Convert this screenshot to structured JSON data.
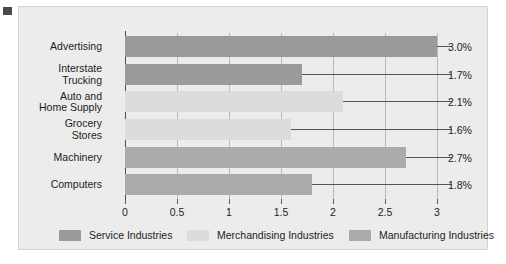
{
  "chart_data": {
    "type": "bar",
    "orientation": "horizontal",
    "title": "",
    "xlabel": "",
    "ylabel": "",
    "xlim": [
      0,
      3
    ],
    "xticks": [
      "0",
      "0.5",
      "1",
      "1.5",
      "2",
      "2.5",
      "3"
    ],
    "grid": true,
    "legend_position": "bottom",
    "categories": [
      "Advertising",
      "Interstate\nTrucking",
      "Auto and\nHome Supply",
      "Grocery\nStores",
      "Machinery",
      "Computers"
    ],
    "values": [
      3.0,
      1.7,
      2.1,
      1.6,
      2.7,
      1.8
    ],
    "value_labels": [
      "3.0%",
      "1.7%",
      "2.1%",
      "1.6%",
      "2.7%",
      "1.8%"
    ],
    "series_of_bar": [
      "Service Industries",
      "Service Industries",
      "Merchandising Industries",
      "Merchandising Industries",
      "Manufacturing Industries",
      "Manufacturing Industries"
    ],
    "legend": [
      {
        "label": "Service Industries",
        "color": "#9a9a9a",
        "key": "service"
      },
      {
        "label": "Merchandising Industries",
        "color": "#dcdcdc",
        "key": "merch"
      },
      {
        "label": "Manufacturing Industries",
        "color": "#ababab",
        "key": "manu"
      }
    ]
  },
  "colors": {
    "panel_background": "#ececec",
    "panel_border": "#d2d2d2",
    "axis": "#4d4d4d",
    "gridline": "#b9b9b9",
    "text": "#1d1d1d",
    "marker": "#4a4a4a"
  }
}
